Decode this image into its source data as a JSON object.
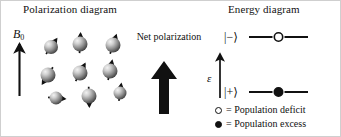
{
  "panels": {
    "polarization": {
      "title": "Polarization diagram",
      "field_label": "B",
      "field_subscript": "0",
      "net_polarization_label": "Net polarization",
      "spins": [
        {
          "cx": 50,
          "cy": 46,
          "angle": 35,
          "r": 7.0
        },
        {
          "cx": 79,
          "cy": 43,
          "angle": 3,
          "r": 7.5
        },
        {
          "cx": 112,
          "cy": 44,
          "angle": 18,
          "r": 7.5
        },
        {
          "cx": 47,
          "cy": 74,
          "angle": -148,
          "r": 7.5
        },
        {
          "cx": 79,
          "cy": 72,
          "angle": 28,
          "r": 7.5
        },
        {
          "cx": 109,
          "cy": 70,
          "angle": 12,
          "r": 7.5
        },
        {
          "cx": 55,
          "cy": 97,
          "angle": 95,
          "r": 6.5
        },
        {
          "cx": 88,
          "cy": 95,
          "angle": 178,
          "r": 7.5
        },
        {
          "cx": 119,
          "cy": 92,
          "angle": 8,
          "r": 6.5
        }
      ]
    },
    "energy": {
      "title": "Energy diagram",
      "energy_axis_label": "ε",
      "levels": [
        {
          "ket": "|−⟩",
          "marker": "open",
          "y": 36
        },
        {
          "ket": "|+⟩",
          "marker": "filled",
          "y": 91
        }
      ]
    }
  },
  "legend": {
    "items": [
      {
        "marker": "open",
        "text": "= Population deficit"
      },
      {
        "marker": "filled",
        "text": "= Population excess"
      }
    ]
  },
  "colors": {
    "ink": "#111111",
    "sphere_light": "#e6e6e6",
    "sphere_mid": "#9a9a9a",
    "sphere_dark": "#4a4a4a",
    "background": "#ffffff"
  }
}
